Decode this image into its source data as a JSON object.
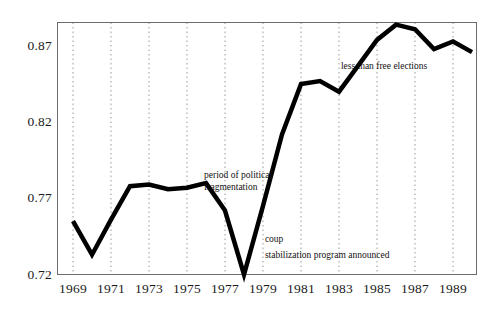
{
  "chart_data": {
    "type": "line",
    "title": "",
    "subtitle": "",
    "xlabel": "",
    "ylabel": "",
    "x": [
      1969,
      1970,
      1971,
      1972,
      1973,
      1974,
      1975,
      1976,
      1977,
      1978,
      1979,
      1980,
      1981,
      1982,
      1983,
      1984,
      1985,
      1986,
      1987,
      1988,
      1989,
      1990
    ],
    "values": [
      0.755,
      0.733,
      0.756,
      0.778,
      0.779,
      0.776,
      0.777,
      0.78,
      0.762,
      0.72,
      0.765,
      0.812,
      0.845,
      0.847,
      0.84,
      0.857,
      0.874,
      0.884,
      0.881,
      0.868,
      0.873,
      0.866
    ],
    "series": [
      {
        "name": "index",
        "values": [
          0.755,
          0.733,
          0.756,
          0.778,
          0.779,
          0.776,
          0.777,
          0.78,
          0.762,
          0.72,
          0.765,
          0.812,
          0.845,
          0.847,
          0.84,
          0.857,
          0.874,
          0.884,
          0.881,
          0.868,
          0.873,
          0.866
        ]
      }
    ],
    "xlim": [
      1968.5,
      1990.5
    ],
    "ylim": [
      0.72,
      0.89
    ],
    "ytick_labels": [
      "0.87",
      "0.82",
      "0.77",
      "0.72"
    ],
    "ytick_values": [
      0.87,
      0.82,
      0.77,
      0.72
    ],
    "xtick_labels": [
      "1969",
      "1971",
      "1973",
      "1975",
      "1977",
      "1979",
      "1981",
      "1983",
      "1985",
      "1987",
      "1989"
    ],
    "xtick_values": [
      1969,
      1971,
      1973,
      1975,
      1977,
      1979,
      1981,
      1983,
      1985,
      1987,
      1989
    ],
    "grid": "vertical-dotted",
    "legend": "none",
    "line_color": "#000000",
    "line_width": 4.5,
    "frame_color": "#6b6b6b",
    "grid_color": "#9a9a9a",
    "annotations": [
      {
        "id": "political-fragmentation",
        "text": "period of political fragmentation",
        "line1": "period of political",
        "line2": "fragmentation",
        "x": 1975.9,
        "y": 0.7845
      },
      {
        "id": "coup",
        "text": "coup",
        "line1": "coup",
        "line2": "",
        "x": 1979.1,
        "y": 0.7425
      },
      {
        "id": "stabilization-program",
        "text": "stabilization program announced",
        "line1": "stabilization program announced",
        "line2": "",
        "x": 1979.1,
        "y": 0.7325
      },
      {
        "id": "less-than-free-elections",
        "text": "less than free elections",
        "line1": "less than free elections",
        "line2": "",
        "x": 1983.1,
        "y": 0.8565
      }
    ]
  }
}
